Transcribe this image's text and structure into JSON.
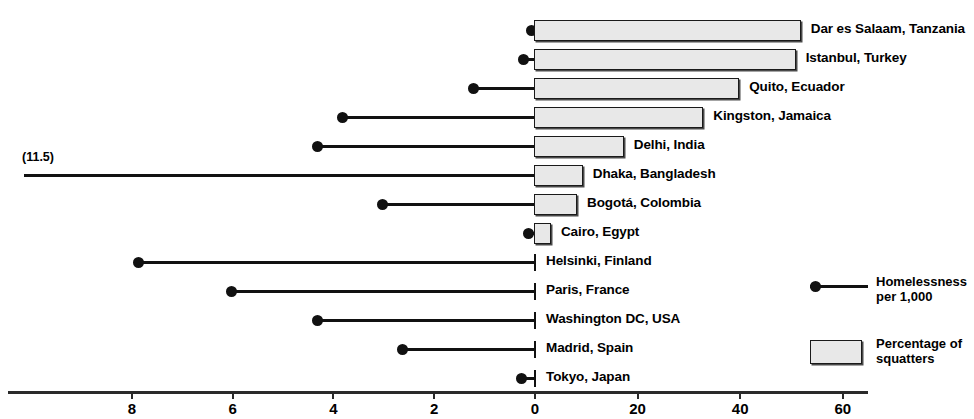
{
  "chart_data": {
    "type": "bar",
    "title": "",
    "subtitle": "",
    "xlabel": "",
    "ylabel": "",
    "grid": false,
    "legend_position": "right",
    "orientation": "horizontal-diverging",
    "axes": {
      "left_axis": {
        "name": "Homelessness per 1,000",
        "ticks": [
          8,
          6,
          4,
          2,
          0
        ],
        "tick_labels": [
          "8",
          "6",
          "4",
          "2",
          "0"
        ],
        "range": [
          8,
          0
        ],
        "direction": "right-to-left"
      },
      "right_axis": {
        "name": "Percentage of squatters",
        "ticks": [
          0,
          20,
          40,
          60
        ],
        "tick_labels": [
          "0",
          "20",
          "40",
          "60"
        ],
        "range": [
          0,
          65
        ],
        "direction": "left-to-right"
      }
    },
    "categories": [
      "Dar es Salaam, Tanzania",
      "Istanbul, Turkey",
      "Quito, Ecuador",
      "Kingston, Jamaica",
      "Delhi, India",
      "Dhaka, Bangladesh",
      "Bogotá, Colombia",
      "Cairo, Egypt",
      "Helsinki, Finland",
      "Paris, France",
      "Washington DC, USA",
      "Madrid, Spain",
      "Tokyo, Japan"
    ],
    "series": [
      {
        "name": "Percentage of squatters",
        "unit": "%",
        "values": [
          52,
          51,
          40,
          33,
          17.5,
          9.5,
          8.4,
          3.3,
          0,
          0,
          0,
          0,
          0
        ]
      },
      {
        "name": "Homelessness per 1,000",
        "unit": "per 1,000",
        "values": [
          0.05,
          0.2,
          1.2,
          3.8,
          4.3,
          11.5,
          3.0,
          0.1,
          7.85,
          6.0,
          4.3,
          2.6,
          0.25
        ]
      }
    ],
    "annotations": [
      {
        "text": "(11.5)",
        "for_category": "Dhaka, Bangladesh",
        "note": "value exceeds plotted axis range"
      }
    ]
  },
  "rows": [
    {
      "label": "Dar es Salaam, Tanzania",
      "squatters_pct": 52,
      "homeless_per_1000": 0.05,
      "has_bar": true
    },
    {
      "label": "Istanbul, Turkey",
      "squatters_pct": 51,
      "homeless_per_1000": 0.2,
      "has_bar": true
    },
    {
      "label": "Quito, Ecuador",
      "squatters_pct": 40,
      "homeless_per_1000": 1.2,
      "has_bar": true
    },
    {
      "label": "Kingston, Jamaica",
      "squatters_pct": 33,
      "homeless_per_1000": 3.8,
      "has_bar": true
    },
    {
      "label": "Delhi, India",
      "squatters_pct": 17.5,
      "homeless_per_1000": 4.3,
      "has_bar": true
    },
    {
      "label": "Dhaka, Bangladesh",
      "squatters_pct": 9.5,
      "homeless_per_1000": 11.5,
      "has_bar": true,
      "offscale": true
    },
    {
      "label": "Bogotá, Colombia",
      "squatters_pct": 8.4,
      "homeless_per_1000": 3.0,
      "has_bar": true
    },
    {
      "label": "Cairo, Egypt",
      "squatters_pct": 3.3,
      "homeless_per_1000": 0.1,
      "has_bar": true
    },
    {
      "label": "Helsinki, Finland",
      "squatters_pct": 0,
      "homeless_per_1000": 7.85,
      "has_bar": false
    },
    {
      "label": "Paris, France",
      "squatters_pct": 0,
      "homeless_per_1000": 6.0,
      "has_bar": false
    },
    {
      "label": "Washington DC, USA",
      "squatters_pct": 0,
      "homeless_per_1000": 4.3,
      "has_bar": false
    },
    {
      "label": "Madrid, Spain",
      "squatters_pct": 0,
      "homeless_per_1000": 2.6,
      "has_bar": false
    },
    {
      "label": "Tokyo, Japan",
      "squatters_pct": 0,
      "homeless_per_1000": 0.25,
      "has_bar": false
    }
  ],
  "annotation": {
    "text": "(11.5)"
  },
  "axis": {
    "left_ticks": [
      "8",
      "6",
      "4",
      "2"
    ],
    "zero_tick": "0",
    "right_ticks": [
      "20",
      "40",
      "60"
    ]
  },
  "legend": {
    "entries": [
      {
        "key": "homelessness",
        "symbol": "dot-line",
        "text": "Homelessness\nper 1,000"
      },
      {
        "key": "squatters",
        "symbol": "box",
        "text": "Percentage of\nsquatters"
      }
    ]
  },
  "colors": {
    "bar_fill": "#e8e8e8",
    "bar_stroke": "#1a1a1a",
    "bar_shadow": "#4a4a4a",
    "stem": "#111111",
    "axis": "#2a2a2a",
    "text": "#000000",
    "background": "#ffffff"
  }
}
